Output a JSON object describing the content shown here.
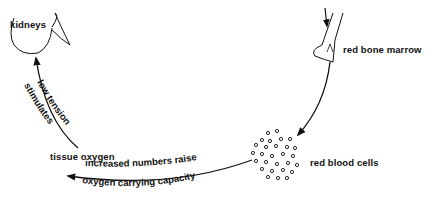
{
  "nodes": {
    "kidneys": "kidneys",
    "red_bone_marrow": "red bone marrow",
    "red_blood_cells": "red blood cells",
    "tissue_oxygen": "tissue oxygen"
  },
  "edges": {
    "tissue_to_kidneys": [
      "low tension",
      "stimulates"
    ],
    "rbc_to_tissue": [
      "increased numbers raise",
      "oxygen carrying capacity"
    ]
  },
  "colors": {
    "line": "#111111",
    "background": "#ffffff"
  }
}
